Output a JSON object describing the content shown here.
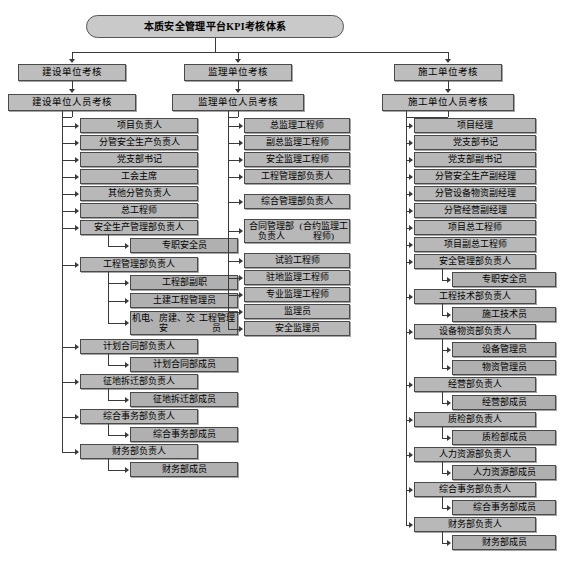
{
  "diagram": {
    "title": "本质安全管理平台KPI考核体系",
    "root_id": "root",
    "branches": [
      {
        "id": "branch-construction-owner",
        "level2": "建设单位考核",
        "level3": "建设单位人员考核",
        "column": "left"
      },
      {
        "id": "branch-supervision",
        "level2": "监理单位考核",
        "level3": "监理单位人员考核",
        "column": "middle"
      },
      {
        "id": "branch-contractor",
        "level2": "施工单位考核",
        "level3": "施工单位人员考核",
        "column": "right"
      }
    ],
    "left_column": {
      "items": [
        {
          "label": "项目负责人",
          "children": []
        },
        {
          "label": "分管安全生产负责人",
          "children": []
        },
        {
          "label": "党支部书记",
          "children": []
        },
        {
          "label": "工会主席",
          "children": []
        },
        {
          "label": "其他分管负责人",
          "children": []
        },
        {
          "label": "总工程师",
          "children": []
        },
        {
          "label": "安全生产管理部负责人",
          "children": [
            "专职安全员"
          ]
        },
        {
          "label": "工程管理部负责人",
          "children": [
            "工程部副职",
            "土建工程管理员",
            "机电、房建、交安\n工程管理员"
          ]
        },
        {
          "label": "计划合同部负责人",
          "children": [
            "计划合同部成员"
          ]
        },
        {
          "label": "征地拆迁部负责人",
          "children": [
            "征地拆迁部成员"
          ]
        },
        {
          "label": "综合事务部负责人",
          "children": [
            "综合事务部成员"
          ]
        },
        {
          "label": "财务部负责人",
          "children": [
            "财务部成员"
          ]
        }
      ]
    },
    "middle_column": {
      "items": [
        {
          "label": "总监理工程师",
          "children": []
        },
        {
          "label": "副总监理工程师",
          "children": []
        },
        {
          "label": "安全监理工程师",
          "children": []
        },
        {
          "label": "工程管理部负责人",
          "children": []
        },
        {
          "label": "综合管理部负责人",
          "children": []
        },
        {
          "label": "合同管理部负责人\n(合约监理工程师)",
          "children": []
        },
        {
          "label": "试验工程师",
          "children": []
        },
        {
          "label": "驻地监理工程师",
          "children": []
        },
        {
          "label": "专业监理工程师",
          "children": []
        },
        {
          "label": "监理员",
          "children": []
        },
        {
          "label": "安全监理员",
          "children": []
        }
      ]
    },
    "right_column": {
      "items": [
        {
          "label": "项目经理",
          "children": []
        },
        {
          "label": "党支部书记",
          "children": []
        },
        {
          "label": "党支部副书记",
          "children": []
        },
        {
          "label": "分管安全生产副经理",
          "children": []
        },
        {
          "label": "分管设备物资副经理",
          "children": []
        },
        {
          "label": "分管经营副经理",
          "children": []
        },
        {
          "label": "项目总工程师",
          "children": []
        },
        {
          "label": "项目副总工程师",
          "children": []
        },
        {
          "label": "安全管理部负责人",
          "children": [
            "专职安全员"
          ]
        },
        {
          "label": "工程技术部负责人",
          "children": [
            "施工技术员"
          ]
        },
        {
          "label": "设备物资部负责人",
          "children": [
            "设备管理员",
            "物资管理员"
          ]
        },
        {
          "label": "经营部负责人",
          "children": [
            "经营部成员"
          ]
        },
        {
          "label": "质检部负责人",
          "children": [
            "质检部成员"
          ]
        },
        {
          "label": "人力资源部负责人",
          "children": [
            "人力资源部成员"
          ]
        },
        {
          "label": "综合事务部负责人",
          "children": [
            "综合事务部成员"
          ]
        },
        {
          "label": "财务部负责人",
          "children": [
            "财务部成员"
          ]
        }
      ]
    },
    "colors": {
      "box_fill": "#b8b8b8",
      "box_border": "#4a4a4a",
      "title_fill": "#c9c9c9",
      "line": "#3a3a3a",
      "background": "#ffffff"
    }
  }
}
